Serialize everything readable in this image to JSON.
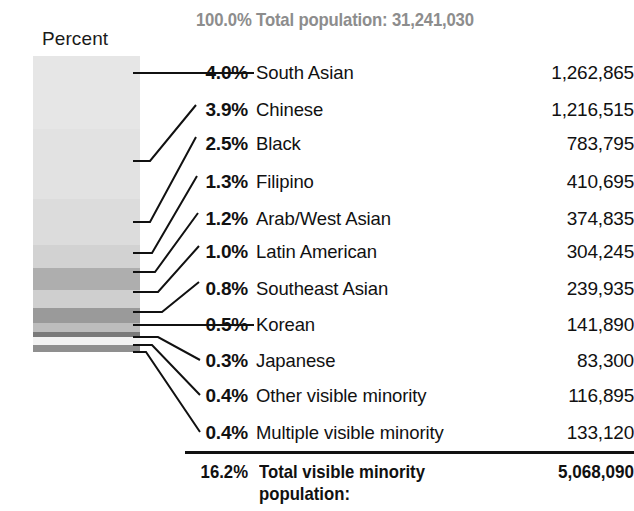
{
  "title": "100.0% Total population: 31,241,030",
  "axis_legend_label": "Percent",
  "colors": {
    "title_gray": "#8d8d8d",
    "text_black": "#111111",
    "rule_black": "#111111"
  },
  "chart_data": {
    "type": "bar",
    "title": "100.0% Total population: 31,241,030",
    "subtitle": "",
    "xlabel": "",
    "ylabel": "Percent",
    "legend_position": "none",
    "grid": false,
    "orientation": "stacked-vertical",
    "total_population": "31,241,030",
    "total_percent": "100.0%",
    "categories": [
      "South Asian",
      "Chinese",
      "Black",
      "Filipino",
      "Arab/West Asian",
      "Latin American",
      "Southeast Asian",
      "Korean",
      "Japanese",
      "Other visible minority",
      "Multiple visible minority"
    ],
    "values": [
      4.0,
      3.9,
      2.5,
      1.3,
      1.2,
      1.0,
      0.8,
      0.5,
      0.3,
      0.4,
      0.4
    ],
    "counts": [
      1262865,
      1216515,
      783795,
      410695,
      374835,
      304245,
      239935,
      141890,
      83300,
      116895,
      133120
    ],
    "ylim": [
      0,
      16.2
    ]
  },
  "rows": [
    {
      "pct": "4.0%",
      "label": "South Asian",
      "value": "1,262,865",
      "shade": "#e6e6e6"
    },
    {
      "pct": "3.9%",
      "label": "Chinese",
      "value": "1,216,515",
      "shade": "#e2e2e2"
    },
    {
      "pct": "2.5%",
      "label": "Black",
      "value": "783,795",
      "shade": "#dcdcdc"
    },
    {
      "pct": "1.3%",
      "label": "Filipino",
      "value": "410,695",
      "shade": "#d2d2d2"
    },
    {
      "pct": "1.2%",
      "label": "Arab/West Asian",
      "value": "374,835",
      "shade": "#aeaeae"
    },
    {
      "pct": "1.0%",
      "label": "Latin American",
      "value": "304,245",
      "shade": "#cfcfcf"
    },
    {
      "pct": "0.8%",
      "label": "Southeast Asian",
      "value": "239,935",
      "shade": "#9a9a9a"
    },
    {
      "pct": "0.5%",
      "label": "Korean",
      "value": "141,890",
      "shade": "#bdbdbd"
    },
    {
      "pct": "0.3%",
      "label": "Japanese",
      "value": "83,300",
      "shade": "#7a7a7a"
    },
    {
      "pct": "0.4%",
      "label": "Other visible minority",
      "value": "116,895",
      "shade": "#f2f2f2"
    },
    {
      "pct": "0.4%",
      "label": "Multiple visible minority",
      "value": "133,120",
      "shade": "#8f8f8f"
    }
  ],
  "total": {
    "pct": "16.2%",
    "label": "Total visible minority population:",
    "value": "5,068,090"
  }
}
